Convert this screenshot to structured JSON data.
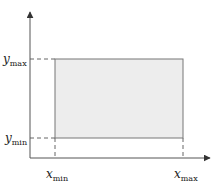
{
  "diagram": {
    "type": "bounding-box-diagram",
    "colors": {
      "axis": "#555555",
      "rect_fill": "#ededed",
      "rect_stroke": "#777777",
      "dash": "#666666"
    },
    "labels": {
      "y_max": {
        "base": "y",
        "sub": "max"
      },
      "y_min": {
        "base": "y",
        "sub": "min"
      },
      "x_min": {
        "base": "x",
        "sub": "min"
      },
      "x_max": {
        "base": "x",
        "sub": "max"
      }
    },
    "geometry": {
      "origin": [
        30,
        158
      ],
      "y_axis_top": 12,
      "x_axis_right": 210,
      "rect": {
        "x": 55,
        "y": 59,
        "width": 128,
        "height": 79
      }
    }
  }
}
